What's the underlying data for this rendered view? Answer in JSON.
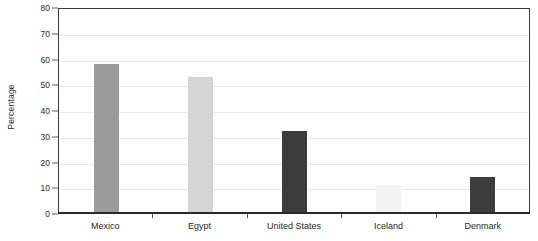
{
  "chart_data": {
    "type": "bar",
    "title": "",
    "xlabel": "",
    "ylabel": "Percentage",
    "categories": [
      "Mexico",
      "Egypt",
      "United States",
      "Iceland",
      "Denmark"
    ],
    "values": [
      58,
      53,
      32,
      11,
      14
    ],
    "bar_colors": [
      "#9b9b9b",
      "#d4d4d4",
      "#3c3c3c",
      "#f4f4f4",
      "#3c3c3c"
    ],
    "ylim": [
      0,
      80
    ],
    "yticks": [
      0,
      10,
      20,
      30,
      40,
      50,
      60,
      70,
      80
    ],
    "ytick_labels": [
      "0",
      "10",
      "20",
      "30",
      "40",
      "50",
      "60",
      "70",
      "80"
    ],
    "grid": true,
    "legend": "none",
    "frame_color": "#3d3d3d",
    "grid_color": "#e9e9e9",
    "axis_color": "#2a2a2a"
  }
}
